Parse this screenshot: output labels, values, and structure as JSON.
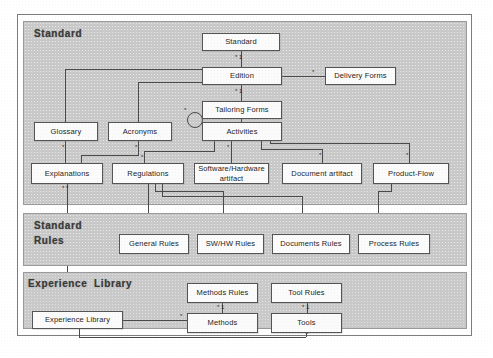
{
  "diagram": {
    "type": "uml-package-class-diagram",
    "packages": [
      {
        "id": "standard",
        "title": "Standard",
        "nodes": [
          {
            "id": "standard-class",
            "label": "Standard"
          },
          {
            "id": "edition",
            "label": "Edition"
          },
          {
            "id": "delivery-forms",
            "label": "Delivery Forms"
          },
          {
            "id": "tailoring-forms",
            "label": "Tailoring Forms"
          },
          {
            "id": "glossary",
            "label": "Glossary"
          },
          {
            "id": "acronyms",
            "label": "Acronyms"
          },
          {
            "id": "activities",
            "label": "Activities"
          },
          {
            "id": "explanations",
            "label": "Explanations"
          },
          {
            "id": "regulations",
            "label": "Regulations"
          },
          {
            "id": "sw-hw-artifact",
            "label": "Software/Hardware\nartifact"
          },
          {
            "id": "document-artifact",
            "label": "Document artifact"
          },
          {
            "id": "product-flow",
            "label": "Product-Flow"
          }
        ]
      },
      {
        "id": "standard-rules",
        "title": "Standard\nRules",
        "nodes": [
          {
            "id": "general-rules",
            "label": "General Rules"
          },
          {
            "id": "sw-hw-rules",
            "label": "SW/HW Rules"
          },
          {
            "id": "documents-rules",
            "label": "Documents Rules"
          },
          {
            "id": "process-rules",
            "label": "Process Rules"
          }
        ]
      },
      {
        "id": "experience-library",
        "title": "Experience  Library",
        "nodes": [
          {
            "id": "methods-rules",
            "label": "Methods Rules"
          },
          {
            "id": "tool-rules",
            "label": "Tool Rules"
          },
          {
            "id": "experience-library-class",
            "label": "Experience Library"
          },
          {
            "id": "methods",
            "label": "Methods"
          },
          {
            "id": "tools",
            "label": "Tools"
          }
        ]
      }
    ],
    "multiplicities": {
      "star": "*",
      "one": "1",
      "star_one": "* 1",
      "star_star": "* *"
    }
  },
  "colors": {
    "package_fill": "#c9c9c9",
    "node_fill": "#fbfbfb",
    "line": "#4a4a4a",
    "frame": "#7d7d7d",
    "text": "#1d1d1d"
  }
}
